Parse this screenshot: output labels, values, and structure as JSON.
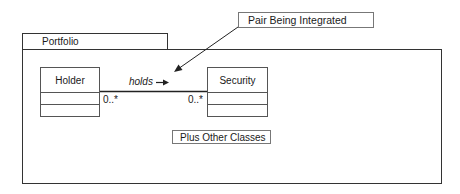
{
  "diagram": {
    "type": "UML class diagram",
    "package": {
      "name": "Portfolio"
    },
    "classes": [
      {
        "name": "Holder",
        "compartments": [
          "",
          ""
        ]
      },
      {
        "name": "Security",
        "compartments": [
          "",
          ""
        ]
      }
    ],
    "association": {
      "name": "holds",
      "direction_arrow": "→",
      "source_multiplicity": "0..*",
      "target_multiplicity": "0..*"
    },
    "annotations": {
      "callout": "Pair Being Integrated",
      "note": "Plus Other Classes"
    },
    "colors": {
      "line": "#333333",
      "background": "#ffffff"
    }
  }
}
